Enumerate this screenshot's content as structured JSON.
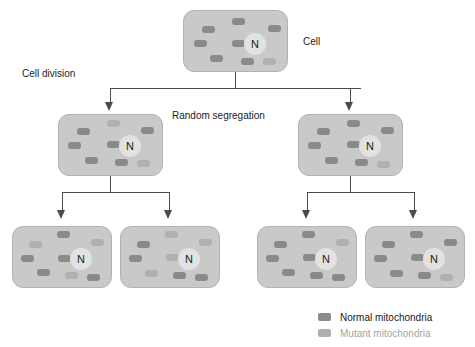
{
  "figure": {
    "width": 475,
    "height": 347,
    "background": "#ffffff"
  },
  "colors": {
    "cell_fill": "#c9c9c9",
    "cell_border": "#b3b3b3",
    "nucleus_fill": "#e2e2e2",
    "normal_mitochondria": "#8a8a8a",
    "mutant_mitochondria": "#b0b0b0",
    "connector": "#4a4a4a",
    "label_text": "#232323",
    "legend_normal_text": "#1a1a1a",
    "legend_mutant_text": "#a3a3a3"
  },
  "labels": {
    "cell": "Cell",
    "cell_division": "Cell division",
    "random_segregation": "Random segregation",
    "nucleus": "N"
  },
  "legend": {
    "items": [
      {
        "label": "Normal mitochondria",
        "color": "#8a8a8a",
        "text_color": "#1a1a1a"
      },
      {
        "label": "Mutant mitochondria",
        "color": "#b0b0b0",
        "text_color": "#a3a3a3"
      }
    ]
  },
  "generations": [
    {
      "level": 1,
      "cells": [
        {
          "id": "parent-cell",
          "x": 183,
          "y": 10,
          "w": 105,
          "h": 62,
          "nucleus": {
            "x": 60,
            "y": 22,
            "d": 22
          },
          "mitochondria": [
            {
              "x": 18,
              "y": 15,
              "w": 13,
              "h": 7,
              "type": "normal"
            },
            {
              "x": 48,
              "y": 7,
              "w": 13,
              "h": 7,
              "type": "normal"
            },
            {
              "x": 84,
              "y": 14,
              "w": 13,
              "h": 7,
              "type": "normal"
            },
            {
              "x": 10,
              "y": 29,
              "w": 13,
              "h": 7,
              "type": "normal"
            },
            {
              "x": 48,
              "y": 29,
              "w": 13,
              "h": 7,
              "type": "normal"
            },
            {
              "x": 26,
              "y": 44,
              "w": 13,
              "h": 7,
              "type": "normal"
            },
            {
              "x": 57,
              "y": 47,
              "w": 13,
              "h": 7,
              "type": "normal"
            },
            {
              "x": 79,
              "y": 47,
              "w": 13,
              "h": 7,
              "type": "mutant"
            }
          ]
        }
      ]
    },
    {
      "level": 2,
      "cells": [
        {
          "id": "daughter-cell-left",
          "x": 58,
          "y": 114,
          "w": 105,
          "h": 62,
          "nucleus": {
            "x": 60,
            "y": 20,
            "d": 22
          },
          "mitochondria": [
            {
              "x": 18,
              "y": 13,
              "w": 13,
              "h": 7,
              "type": "normal"
            },
            {
              "x": 48,
              "y": 5,
              "w": 13,
              "h": 7,
              "type": "mutant"
            },
            {
              "x": 82,
              "y": 12,
              "w": 13,
              "h": 7,
              "type": "normal"
            },
            {
              "x": 9,
              "y": 27,
              "w": 13,
              "h": 7,
              "type": "normal"
            },
            {
              "x": 48,
              "y": 26,
              "w": 13,
              "h": 7,
              "type": "normal"
            },
            {
              "x": 26,
              "y": 42,
              "w": 13,
              "h": 7,
              "type": "normal"
            },
            {
              "x": 56,
              "y": 44,
              "w": 13,
              "h": 7,
              "type": "normal"
            },
            {
              "x": 78,
              "y": 45,
              "w": 13,
              "h": 7,
              "type": "mutant"
            }
          ]
        },
        {
          "id": "daughter-cell-right",
          "x": 298,
          "y": 114,
          "w": 105,
          "h": 62,
          "nucleus": {
            "x": 60,
            "y": 20,
            "d": 22
          },
          "mitochondria": [
            {
              "x": 18,
              "y": 13,
              "w": 13,
              "h": 7,
              "type": "normal"
            },
            {
              "x": 48,
              "y": 5,
              "w": 13,
              "h": 7,
              "type": "normal"
            },
            {
              "x": 82,
              "y": 12,
              "w": 13,
              "h": 7,
              "type": "normal"
            },
            {
              "x": 9,
              "y": 27,
              "w": 13,
              "h": 7,
              "type": "normal"
            },
            {
              "x": 48,
              "y": 26,
              "w": 13,
              "h": 7,
              "type": "normal"
            },
            {
              "x": 26,
              "y": 42,
              "w": 13,
              "h": 7,
              "type": "normal"
            },
            {
              "x": 56,
              "y": 44,
              "w": 13,
              "h": 7,
              "type": "normal"
            },
            {
              "x": 78,
              "y": 46,
              "w": 13,
              "h": 7,
              "type": "mutant"
            }
          ]
        }
      ]
    },
    {
      "level": 3,
      "cells": [
        {
          "id": "granddaughter-cell-1",
          "x": 12,
          "y": 226,
          "w": 100,
          "h": 62,
          "nucleus": {
            "x": 57,
            "y": 21,
            "d": 22
          },
          "mitochondria": [
            {
              "x": 16,
              "y": 14,
              "w": 13,
              "h": 7,
              "type": "mutant"
            },
            {
              "x": 44,
              "y": 4,
              "w": 13,
              "h": 7,
              "type": "normal"
            },
            {
              "x": 78,
              "y": 12,
              "w": 13,
              "h": 7,
              "type": "mutant"
            },
            {
              "x": 8,
              "y": 28,
              "w": 13,
              "h": 7,
              "type": "normal"
            },
            {
              "x": 45,
              "y": 28,
              "w": 13,
              "h": 7,
              "type": "normal"
            },
            {
              "x": 24,
              "y": 42,
              "w": 13,
              "h": 7,
              "type": "normal"
            },
            {
              "x": 52,
              "y": 45,
              "w": 13,
              "h": 7,
              "type": "mutant"
            },
            {
              "x": 74,
              "y": 47,
              "w": 13,
              "h": 7,
              "type": "normal"
            }
          ]
        },
        {
          "id": "granddaughter-cell-2",
          "x": 120,
          "y": 226,
          "w": 100,
          "h": 62,
          "nucleus": {
            "x": 57,
            "y": 21,
            "d": 22
          },
          "mitochondria": [
            {
              "x": 16,
              "y": 14,
              "w": 13,
              "h": 7,
              "type": "normal"
            },
            {
              "x": 44,
              "y": 4,
              "w": 13,
              "h": 7,
              "type": "mutant"
            },
            {
              "x": 78,
              "y": 12,
              "w": 13,
              "h": 7,
              "type": "mutant"
            },
            {
              "x": 8,
              "y": 28,
              "w": 13,
              "h": 7,
              "type": "normal"
            },
            {
              "x": 45,
              "y": 27,
              "w": 13,
              "h": 7,
              "type": "mutant"
            },
            {
              "x": 24,
              "y": 43,
              "w": 13,
              "h": 7,
              "type": "mutant"
            },
            {
              "x": 52,
              "y": 45,
              "w": 13,
              "h": 7,
              "type": "normal"
            },
            {
              "x": 74,
              "y": 47,
              "w": 13,
              "h": 7,
              "type": "normal"
            }
          ]
        },
        {
          "id": "granddaughter-cell-3",
          "x": 257,
          "y": 226,
          "w": 100,
          "h": 62,
          "nucleus": {
            "x": 57,
            "y": 21,
            "d": 22
          },
          "mitochondria": [
            {
              "x": 16,
              "y": 14,
              "w": 13,
              "h": 7,
              "type": "normal"
            },
            {
              "x": 44,
              "y": 4,
              "w": 13,
              "h": 7,
              "type": "normal"
            },
            {
              "x": 78,
              "y": 12,
              "w": 13,
              "h": 7,
              "type": "mutant"
            },
            {
              "x": 8,
              "y": 28,
              "w": 13,
              "h": 7,
              "type": "normal"
            },
            {
              "x": 45,
              "y": 27,
              "w": 13,
              "h": 7,
              "type": "normal"
            },
            {
              "x": 24,
              "y": 42,
              "w": 13,
              "h": 7,
              "type": "normal"
            },
            {
              "x": 52,
              "y": 45,
              "w": 13,
              "h": 7,
              "type": "normal"
            },
            {
              "x": 74,
              "y": 47,
              "w": 13,
              "h": 7,
              "type": "normal"
            }
          ]
        },
        {
          "id": "granddaughter-cell-4",
          "x": 365,
          "y": 226,
          "w": 100,
          "h": 62,
          "nucleus": {
            "x": 57,
            "y": 21,
            "d": 22
          },
          "mitochondria": [
            {
              "x": 16,
              "y": 14,
              "w": 13,
              "h": 7,
              "type": "normal"
            },
            {
              "x": 44,
              "y": 4,
              "w": 13,
              "h": 7,
              "type": "normal"
            },
            {
              "x": 78,
              "y": 12,
              "w": 13,
              "h": 7,
              "type": "normal"
            },
            {
              "x": 8,
              "y": 28,
              "w": 13,
              "h": 7,
              "type": "normal"
            },
            {
              "x": 45,
              "y": 27,
              "w": 13,
              "h": 7,
              "type": "normal"
            },
            {
              "x": 24,
              "y": 43,
              "w": 13,
              "h": 7,
              "type": "normal"
            },
            {
              "x": 52,
              "y": 45,
              "w": 13,
              "h": 7,
              "type": "normal"
            },
            {
              "x": 74,
              "y": 47,
              "w": 13,
              "h": 7,
              "type": "mutant"
            }
          ]
        }
      ]
    }
  ],
  "connectors": {
    "division_1": {
      "stem": {
        "x": 235,
        "y": 72,
        "h": 16
      },
      "bar": {
        "x": 110,
        "y": 88,
        "w": 251
      },
      "drops": [
        {
          "x": 110,
          "y": 88,
          "h": 16
        },
        {
          "x": 350,
          "y": 88,
          "h": 16
        }
      ],
      "arrows": [
        {
          "x": 105,
          "y": 102
        },
        {
          "x": 345,
          "y": 102
        }
      ]
    },
    "division_2_left": {
      "stem": {
        "x": 110,
        "y": 176,
        "h": 16
      },
      "bar": {
        "x": 62,
        "y": 192,
        "w": 108
      },
      "drops": [
        {
          "x": 62,
          "y": 192,
          "h": 20
        },
        {
          "x": 169,
          "y": 192,
          "h": 20
        }
      ],
      "arrows": [
        {
          "x": 57,
          "y": 210
        },
        {
          "x": 164,
          "y": 210
        }
      ]
    },
    "division_2_right": {
      "stem": {
        "x": 350,
        "y": 176,
        "h": 16
      },
      "bar": {
        "x": 307,
        "y": 192,
        "w": 108
      },
      "drops": [
        {
          "x": 307,
          "y": 192,
          "h": 20
        },
        {
          "x": 414,
          "y": 192,
          "h": 20
        }
      ],
      "arrows": [
        {
          "x": 302,
          "y": 210
        },
        {
          "x": 409,
          "y": 210
        }
      ]
    }
  },
  "label_positions": {
    "cell": {
      "x": 303,
      "y": 36
    },
    "cell_division": {
      "x": 22,
      "y": 68
    },
    "random_segregation": {
      "x": 172,
      "y": 110
    }
  }
}
